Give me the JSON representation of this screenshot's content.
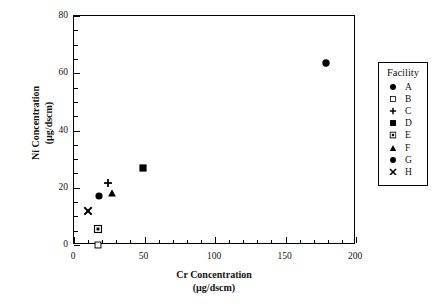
{
  "chart_data": {
    "type": "scatter",
    "title": "",
    "xlabel": "Cr  Concentration",
    "xlabel_units": "(µg/dscm)",
    "ylabel": "Ni  Concentration",
    "ylabel_units": "(µg/dscm)",
    "xlim": [
      0,
      200
    ],
    "ylim": [
      0,
      80
    ],
    "xticks": [
      0,
      50,
      100,
      150,
      200
    ],
    "xtick_labels": [
      "0",
      "50",
      "100",
      "150",
      "200"
    ],
    "x_minor_step": 10,
    "yticks": [
      0,
      20,
      40,
      60,
      80
    ],
    "ytick_labels": [
      "0",
      "20",
      "40",
      "60",
      "80"
    ],
    "y_minor_step": 5,
    "grid": false,
    "legend_position": "right-outside",
    "legend_title": "Facility",
    "series": [
      {
        "name": "A",
        "marker": "filled-diamond",
        "x": [
          179
        ],
        "y": [
          63.5
        ]
      },
      {
        "name": "B",
        "marker": "open-square",
        "x": [
          17
        ],
        "y": [
          0
        ]
      },
      {
        "name": "C",
        "marker": "plus",
        "x": [
          24
        ],
        "y": [
          21.5
        ]
      },
      {
        "name": "D",
        "marker": "filled-square",
        "x": [
          49
        ],
        "y": [
          27
        ]
      },
      {
        "name": "E",
        "marker": "square-dot",
        "x": [
          17
        ],
        "y": [
          5.5
        ]
      },
      {
        "name": "F",
        "marker": "filled-triangle",
        "x": [
          27
        ],
        "y": [
          18
        ]
      },
      {
        "name": "G",
        "marker": "filled-circle",
        "x": [
          18
        ],
        "y": [
          17
        ]
      },
      {
        "name": "H",
        "marker": "x-cross",
        "x": [
          10
        ],
        "y": [
          12
        ]
      }
    ]
  },
  "legend": {
    "title": "Facility",
    "items": [
      {
        "label": "A",
        "marker": "filled-diamond"
      },
      {
        "label": "B",
        "marker": "open-square"
      },
      {
        "label": "C",
        "marker": "plus"
      },
      {
        "label": "D",
        "marker": "filled-square"
      },
      {
        "label": "E",
        "marker": "square-dot"
      },
      {
        "label": "F",
        "marker": "filled-triangle"
      },
      {
        "label": "G",
        "marker": "filled-circle"
      },
      {
        "label": "H",
        "marker": "x-cross"
      }
    ]
  },
  "colors": {
    "marker": "#000000",
    "axis": "#000000",
    "background": "#ffffff"
  }
}
